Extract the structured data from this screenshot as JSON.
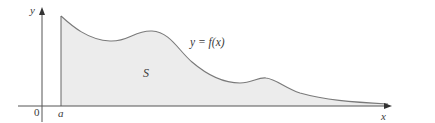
{
  "figure": {
    "type": "area-under-curve",
    "labels": {
      "y_axis": "y",
      "x_axis": "x",
      "origin": "0",
      "lower_bound": "a",
      "region": "S",
      "curve": "y = f(x)"
    },
    "colors": {
      "fill": "#ececec",
      "curve": "#7a7a7a",
      "axis": "#555555",
      "text": "#3a3a3a"
    },
    "axes": {
      "y_axis_x": 42,
      "x_axis_y": 106,
      "x_axis_start": 18,
      "x_axis_end": 391,
      "y_axis_top": 8,
      "y_axis_bottom": 122
    },
    "region_bounds": {
      "left": "a",
      "right": "unbounded (tends to infinity)",
      "top": "y = f(x)",
      "bottom": "x-axis"
    }
  }
}
